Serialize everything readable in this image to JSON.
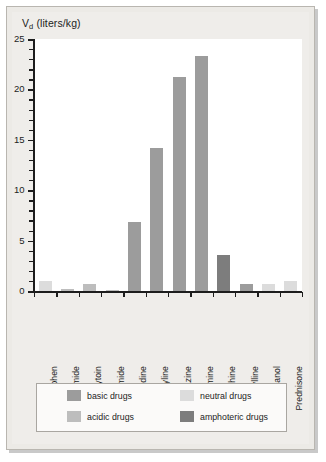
{
  "chart_data": {
    "type": "bar",
    "title": "Vd (liters/kg)",
    "title_main": "V",
    "title_sub": "d",
    "title_rest": " (liters/kg)",
    "xlabel": "",
    "ylabel": "Vd (liters/kg)",
    "ylim": [
      0,
      25
    ],
    "grid": false,
    "legend_position": "bottom",
    "ytick_labels": [
      "25",
      "20",
      "15",
      "10",
      "5",
      "0"
    ],
    "ytick_values": [
      25,
      20,
      15,
      10,
      5,
      0
    ],
    "yminor_step": 1,
    "categories": [
      "Acetaminophen",
      "Furosemide",
      "Phenytoin",
      "Tolbutamide",
      "Amantadine",
      "Amitriptyline",
      "Chlorpromazine",
      "Imipramine",
      "Morphine",
      "Theophylline",
      "Ethanol",
      "Prednisone"
    ],
    "values": [
      1.0,
      0.2,
      0.7,
      0.15,
      6.8,
      14.2,
      21.2,
      23.3,
      3.6,
      0.7,
      0.65,
      1.0
    ],
    "bar_classes": [
      "neutral",
      "acidic",
      "acidic",
      "acidic",
      "basic",
      "basic",
      "basic",
      "basic",
      "amphoteric",
      "basic",
      "neutral",
      "neutral"
    ],
    "colors": {
      "basic": "#9c9c9c",
      "neutral": "#dcdcdc",
      "acidic": "#bdbdbd",
      "amphoteric": "#7d7d7d"
    },
    "legend": [
      {
        "label": "basic drugs",
        "key": "basic",
        "color": "#9c9c9c"
      },
      {
        "label": "neutral drugs",
        "key": "neutral",
        "color": "#dcdcdc"
      },
      {
        "label": "acidic drugs",
        "key": "acidic",
        "color": "#bdbdbd"
      },
      {
        "label": "amphoteric drugs",
        "key": "amphoteric",
        "color": "#7d7d7d"
      }
    ]
  }
}
